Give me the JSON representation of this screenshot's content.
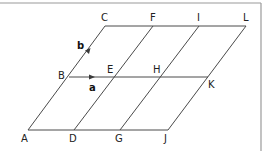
{
  "diagram": {
    "type": "parallelogram-grid",
    "points": {
      "A": "A",
      "B": "B",
      "C": "C",
      "D": "D",
      "E": "E",
      "F": "F",
      "G": "G",
      "H": "H",
      "I": "I",
      "J": "J",
      "K": "K",
      "L": "L"
    },
    "vectors": {
      "a": {
        "label": "a",
        "from": "B",
        "to": "E"
      },
      "b": {
        "label": "b",
        "from": "B",
        "to": "C"
      }
    },
    "edges": [
      [
        "A",
        "J"
      ],
      [
        "B",
        "K"
      ],
      [
        "C",
        "L"
      ],
      [
        "A",
        "C"
      ],
      [
        "D",
        "F"
      ],
      [
        "G",
        "I"
      ],
      [
        "J",
        "L"
      ]
    ]
  }
}
